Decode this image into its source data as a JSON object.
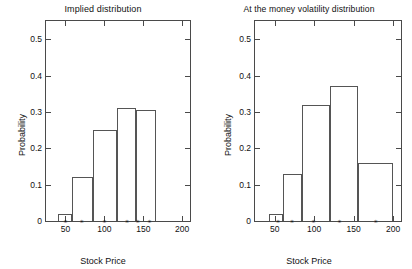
{
  "figure": {
    "xlabel": "Stock Price",
    "ylabel": "Probability"
  },
  "chart_data": [
    {
      "type": "bar",
      "title": "Implied distribution",
      "xlabel": "Stock Price",
      "ylabel": "Probability",
      "xlim": [
        25,
        210
      ],
      "ylim": [
        0,
        0.55
      ],
      "xticks": [
        50,
        100,
        150,
        200
      ],
      "xtick_labels": [
        "50",
        "100",
        "150",
        "200"
      ],
      "yticks": [
        0,
        0.1,
        0.2,
        0.3,
        0.4,
        0.5
      ],
      "ytick_labels": [
        "0",
        "0.1",
        "0.2",
        "0.3",
        "0.4",
        "0.5"
      ],
      "grid": false,
      "legend": "none",
      "bin_edges": [
        41,
        58,
        85,
        116,
        141,
        166
      ],
      "markers_at": [
        50,
        71,
        100,
        129,
        143,
        158
      ],
      "marker_symbol": "*",
      "bars": [
        {
          "left": 41,
          "right": 58,
          "value": 0.02
        },
        {
          "left": 58,
          "right": 85,
          "value": 0.12
        },
        {
          "left": 85,
          "right": 116,
          "value": 0.25
        },
        {
          "left": 116,
          "right": 141,
          "value": 0.31
        },
        {
          "left": 141,
          "right": 166,
          "value": 0.305
        }
      ],
      "values": [
        0.02,
        0.12,
        0.25,
        0.31,
        0.305
      ]
    },
    {
      "type": "bar",
      "title": "At the money volatility distribution",
      "xlabel": "Stock Price",
      "ylabel": "Probability",
      "xlim": [
        25,
        210
      ],
      "ylim": [
        0,
        0.55
      ],
      "xticks": [
        50,
        100,
        150,
        200
      ],
      "xtick_labels": [
        "50",
        "100",
        "150",
        "200"
      ],
      "yticks": [
        0,
        0.1,
        0.2,
        0.3,
        0.4,
        0.5
      ],
      "ytick_labels": [
        "0",
        "0.1",
        "0.2",
        "0.3",
        "0.4",
        "0.5"
      ],
      "grid": false,
      "legend": "none",
      "bin_edges": [
        43,
        61,
        85,
        120,
        156,
        200
      ],
      "markers_at": [
        54,
        72,
        99,
        132,
        178
      ],
      "marker_symbol": "*",
      "bars": [
        {
          "left": 43,
          "right": 61,
          "value": 0.02
        },
        {
          "left": 61,
          "right": 85,
          "value": 0.13
        },
        {
          "left": 85,
          "right": 120,
          "value": 0.32
        },
        {
          "left": 120,
          "right": 156,
          "value": 0.37
        },
        {
          "left": 156,
          "right": 200,
          "value": 0.16
        }
      ],
      "values": [
        0.02,
        0.13,
        0.32,
        0.37,
        0.16
      ]
    }
  ]
}
